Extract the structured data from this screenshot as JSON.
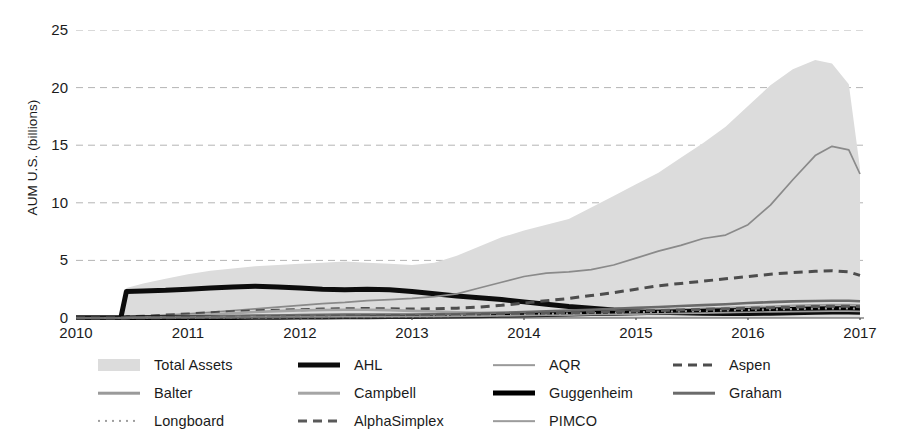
{
  "chart_data": {
    "type": "area",
    "title": "",
    "xlabel": "",
    "ylabel": "AUM U.S. (billions)",
    "xlim": [
      2010,
      2017
    ],
    "ylim": [
      0,
      25
    ],
    "xticks": [
      "2010",
      "2011",
      "2012",
      "2013",
      "2014",
      "2015",
      "2016",
      "2017"
    ],
    "yticks": [
      "0",
      "5",
      "10",
      "15",
      "20",
      "25"
    ],
    "grid": "horizontal-dashed",
    "legend_position": "below",
    "x": [
      2010.0,
      2010.4,
      2010.45,
      2010.6,
      2010.8,
      2011.0,
      2011.2,
      2011.4,
      2011.6,
      2011.8,
      2012.0,
      2012.2,
      2012.4,
      2012.6,
      2012.8,
      2013.0,
      2013.2,
      2013.4,
      2013.6,
      2013.8,
      2014.0,
      2014.2,
      2014.4,
      2014.6,
      2014.8,
      2015.0,
      2015.2,
      2015.4,
      2015.6,
      2015.8,
      2016.0,
      2016.2,
      2016.4,
      2016.6,
      2016.75,
      2016.9,
      2017.0
    ],
    "series": [
      {
        "name": "Total Assets",
        "style": "filled-area",
        "color": "#dcdcdc",
        "values": [
          0.0,
          0.05,
          2.6,
          3.0,
          3.4,
          3.8,
          4.1,
          4.3,
          4.5,
          4.6,
          4.7,
          4.8,
          4.9,
          4.8,
          4.7,
          4.6,
          4.8,
          5.4,
          6.2,
          7.0,
          7.6,
          8.1,
          8.6,
          9.6,
          10.6,
          11.6,
          12.6,
          13.9,
          15.2,
          16.6,
          18.4,
          20.2,
          21.6,
          22.4,
          22.1,
          20.3,
          13.0
        ]
      },
      {
        "name": "AHL",
        "style": "solid-thick",
        "color": "#0d0d0d",
        "values": [
          0.0,
          0.0,
          2.3,
          2.35,
          2.4,
          2.5,
          2.6,
          2.7,
          2.75,
          2.7,
          2.6,
          2.5,
          2.45,
          2.5,
          2.45,
          2.3,
          2.1,
          1.9,
          1.75,
          1.6,
          1.4,
          1.2,
          1.0,
          0.85,
          0.7,
          0.6,
          0.5,
          0.45,
          0.42,
          0.4,
          0.4,
          0.42,
          0.45,
          0.5,
          0.52,
          0.52,
          0.5
        ]
      },
      {
        "name": "AQR",
        "style": "solid-thin",
        "color": "#8a8a8a",
        "values": [
          0.0,
          0.0,
          0.1,
          0.15,
          0.25,
          0.35,
          0.5,
          0.65,
          0.8,
          0.95,
          1.1,
          1.25,
          1.35,
          1.5,
          1.6,
          1.7,
          1.85,
          2.1,
          2.6,
          3.1,
          3.6,
          3.9,
          4.0,
          4.2,
          4.6,
          5.2,
          5.8,
          6.3,
          6.9,
          7.2,
          8.1,
          9.8,
          12.0,
          14.1,
          14.9,
          14.6,
          12.5
        ]
      },
      {
        "name": "Aspen",
        "style": "dashed",
        "color": "#4d4d4d",
        "values": [
          0.0,
          0.0,
          0.1,
          0.15,
          0.25,
          0.35,
          0.45,
          0.55,
          0.62,
          0.68,
          0.72,
          0.78,
          0.8,
          0.82,
          0.8,
          0.78,
          0.8,
          0.85,
          0.95,
          1.1,
          1.3,
          1.5,
          1.7,
          1.95,
          2.2,
          2.5,
          2.8,
          3.0,
          3.2,
          3.4,
          3.6,
          3.8,
          3.95,
          4.05,
          4.1,
          4.0,
          3.7
        ]
      },
      {
        "name": "Balter",
        "style": "solid-medium",
        "color": "#9a9a9a",
        "values": [
          0.0,
          0.0,
          0.02,
          0.03,
          0.04,
          0.05,
          0.06,
          0.07,
          0.08,
          0.09,
          0.1,
          0.11,
          0.12,
          0.13,
          0.14,
          0.15,
          0.17,
          0.2,
          0.24,
          0.28,
          0.33,
          0.38,
          0.43,
          0.5,
          0.56,
          0.62,
          0.68,
          0.74,
          0.8,
          0.86,
          0.92,
          0.98,
          1.05,
          1.1,
          1.12,
          1.12,
          1.1
        ]
      },
      {
        "name": "Campbell",
        "style": "solid-medium",
        "color": "#a5a5a5",
        "values": [
          0.0,
          0.0,
          0.05,
          0.08,
          0.12,
          0.2,
          0.3,
          0.42,
          0.52,
          0.6,
          0.66,
          0.7,
          0.72,
          0.72,
          0.68,
          0.62,
          0.56,
          0.5,
          0.46,
          0.43,
          0.4,
          0.4,
          0.42,
          0.45,
          0.5,
          0.56,
          0.62,
          0.68,
          0.74,
          0.8,
          0.86,
          0.92,
          0.98,
          1.02,
          1.04,
          1.04,
          1.0
        ]
      },
      {
        "name": "Guggenheim",
        "style": "solid-thick",
        "color": "#000000",
        "values": [
          0.0,
          0.0,
          0.01,
          0.02,
          0.02,
          0.03,
          0.04,
          0.05,
          0.06,
          0.07,
          0.08,
          0.09,
          0.1,
          0.11,
          0.12,
          0.13,
          0.15,
          0.17,
          0.2,
          0.23,
          0.26,
          0.3,
          0.34,
          0.38,
          0.42,
          0.46,
          0.5,
          0.54,
          0.58,
          0.62,
          0.66,
          0.7,
          0.74,
          0.78,
          0.8,
          0.8,
          0.78
        ]
      },
      {
        "name": "Graham",
        "style": "solid-medium",
        "color": "#6b6b6b",
        "values": [
          0.0,
          0.0,
          0.03,
          0.05,
          0.07,
          0.1,
          0.13,
          0.16,
          0.19,
          0.22,
          0.25,
          0.27,
          0.29,
          0.3,
          0.3,
          0.3,
          0.32,
          0.35,
          0.4,
          0.46,
          0.52,
          0.58,
          0.64,
          0.72,
          0.8,
          0.88,
          0.96,
          1.04,
          1.12,
          1.2,
          1.3,
          1.38,
          1.44,
          1.48,
          1.5,
          1.5,
          1.45
        ]
      },
      {
        "name": "Longboard",
        "style": "dotted",
        "color": "#9e9e9e",
        "values": [
          0.0,
          0.0,
          0.0,
          0.0,
          0.01,
          0.01,
          0.02,
          0.02,
          0.03,
          0.04,
          0.05,
          0.06,
          0.07,
          0.08,
          0.1,
          0.12,
          0.15,
          0.18,
          0.22,
          0.26,
          0.3,
          0.34,
          0.38,
          0.42,
          0.46,
          0.5,
          0.54,
          0.58,
          0.62,
          0.66,
          0.7,
          0.74,
          0.78,
          0.82,
          0.84,
          0.84,
          0.8
        ]
      },
      {
        "name": "AlphaSimplex",
        "style": "dashed",
        "color": "#5a5a5a",
        "values": [
          0.0,
          0.0,
          0.01,
          0.02,
          0.03,
          0.04,
          0.06,
          0.08,
          0.1,
          0.12,
          0.14,
          0.16,
          0.18,
          0.2,
          0.21,
          0.22,
          0.24,
          0.27,
          0.3,
          0.34,
          0.38,
          0.42,
          0.46,
          0.5,
          0.55,
          0.6,
          0.65,
          0.7,
          0.75,
          0.8,
          0.85,
          0.9,
          0.95,
          1.0,
          1.02,
          1.02,
          0.98
        ]
      },
      {
        "name": "PIMCO",
        "style": "solid-thin",
        "color": "#9c9c9c",
        "values": [
          0.0,
          0.0,
          0.01,
          0.01,
          0.02,
          0.02,
          0.03,
          0.04,
          0.05,
          0.06,
          0.07,
          0.08,
          0.09,
          0.1,
          0.1,
          0.11,
          0.12,
          0.14,
          0.16,
          0.18,
          0.2,
          0.22,
          0.25,
          0.28,
          0.31,
          0.34,
          0.37,
          0.4,
          0.43,
          0.46,
          0.5,
          0.53,
          0.56,
          0.58,
          0.6,
          0.6,
          0.58
        ]
      }
    ]
  },
  "legend": {
    "columns": 4,
    "rows": 3,
    "items": [
      {
        "label": "Total Assets",
        "key": "fill",
        "color": "#dcdcdc",
        "col": 0,
        "row": 0
      },
      {
        "label": "AHL",
        "key": "solid-thick",
        "color": "#0d0d0d",
        "col": 1,
        "row": 0
      },
      {
        "label": "AQR",
        "key": "solid-thin",
        "color": "#9a9a9a",
        "col": 2,
        "row": 0
      },
      {
        "label": "Aspen",
        "key": "dashed",
        "color": "#4d4d4d",
        "col": 3,
        "row": 0
      },
      {
        "label": "Balter",
        "key": "solid-medium",
        "color": "#9a9a9a",
        "col": 0,
        "row": 1
      },
      {
        "label": "Campbell",
        "key": "solid-medium",
        "color": "#a5a5a5",
        "col": 1,
        "row": 1
      },
      {
        "label": "Guggenheim",
        "key": "solid-thick",
        "color": "#000000",
        "col": 2,
        "row": 1
      },
      {
        "label": "Graham",
        "key": "solid-medium",
        "color": "#6b6b6b",
        "col": 3,
        "row": 1
      },
      {
        "label": "Longboard",
        "key": "dotted",
        "color": "#9e9e9e",
        "col": 0,
        "row": 2
      },
      {
        "label": "AlphaSimplex",
        "key": "dashed",
        "color": "#5a5a5a",
        "col": 1,
        "row": 2
      },
      {
        "label": "PIMCO",
        "key": "solid-thin",
        "color": "#9c9c9c",
        "col": 2,
        "row": 2
      }
    ]
  },
  "colors": {
    "axis": "#4a4a4a",
    "grid": "#b4b4b4",
    "area": "#dcdcdc",
    "text": "#1b1b1b"
  }
}
